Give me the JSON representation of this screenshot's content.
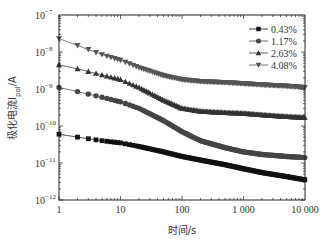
{
  "chart_data": {
    "type": "line",
    "title": "",
    "xlabel": "时间/s",
    "ylabel": "极化电流I_pol/A",
    "xscale": "log",
    "yscale": "log",
    "xlim": [
      1,
      10000
    ],
    "ylim": [
      1e-12,
      1e-07
    ],
    "grid": false,
    "legend_position": "upper right",
    "x_tick_labels": [
      "1",
      "10",
      "100",
      "1 000",
      "10 000"
    ],
    "y_tick_labels": [
      "10^-12",
      "10^-11",
      "10^-10",
      "10^-9",
      "10^-8",
      "10^-7"
    ],
    "x": [
      1,
      2,
      5,
      10,
      20,
      50,
      100,
      200,
      500,
      1000,
      2000,
      5000,
      10000
    ],
    "series": [
      {
        "name": "0.43%",
        "marker": "square",
        "color": "#111111",
        "values": [
          6e-11,
          5e-11,
          4e-11,
          3.5e-11,
          2.8e-11,
          2e-11,
          1.5e-11,
          1.2e-11,
          9e-12,
          7e-12,
          5.5e-12,
          4.3e-12,
          3.5e-12
        ]
      },
      {
        "name": "1.17%",
        "marker": "circle",
        "color": "#444444",
        "values": [
          1.1e-09,
          8.5e-10,
          6e-10,
          4.5e-10,
          3e-10,
          1.4e-10,
          7e-11,
          4e-11,
          2.6e-11,
          2e-11,
          1.7e-11,
          1.5e-11,
          1.4e-11
        ]
      },
      {
        "name": "2.63%",
        "marker": "triangle-up",
        "color": "#333333",
        "values": [
          4.5e-09,
          3.5e-09,
          2.4e-09,
          1.8e-09,
          1.1e-09,
          5e-10,
          3e-10,
          2.5e-10,
          2.3e-10,
          2.2e-10,
          2e-10,
          1.8e-10,
          1.7e-10
        ]
      },
      {
        "name": "4.08%",
        "marker": "triangle-down",
        "color": "#555555",
        "values": [
          2.3e-08,
          1.5e-08,
          8.5e-09,
          6e-09,
          3.8e-09,
          2.3e-09,
          1.8e-09,
          1.6e-09,
          1.5e-09,
          1.4e-09,
          1.3e-09,
          1.2e-09,
          1.1e-09
        ]
      }
    ]
  }
}
